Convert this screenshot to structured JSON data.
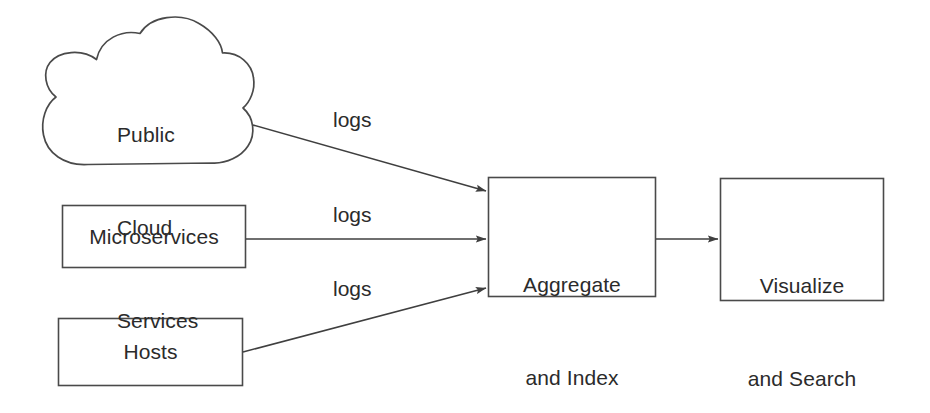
{
  "diagram": {
    "background_color": "#ffffff",
    "stroke_color": "#4a4a4a",
    "text_color": "#2b2b2b",
    "nodes": [
      {
        "id": "public-cloud-services",
        "shape": "cloud",
        "lines": [
          "Public",
          "Cloud",
          "Services"
        ],
        "text": "Public Cloud Services"
      },
      {
        "id": "microservices",
        "shape": "rectangle",
        "lines": [
          "Microservices"
        ],
        "text": "Microservices"
      },
      {
        "id": "hosts",
        "shape": "rectangle",
        "lines": [
          "Hosts"
        ],
        "text": "Hosts"
      },
      {
        "id": "aggregate-and-index",
        "shape": "rectangle",
        "lines": [
          "Aggregate",
          "and Index"
        ],
        "text": "Aggregate and Index"
      },
      {
        "id": "visualize-and-search",
        "shape": "rectangle",
        "lines": [
          "Visualize",
          "and Search"
        ],
        "text": "Visualize and Search"
      }
    ],
    "edges": [
      {
        "id": "cloud-to-aggregate",
        "from": "public-cloud-services",
        "to": "aggregate-and-index",
        "label": "logs"
      },
      {
        "id": "microservices-to-aggregate",
        "from": "microservices",
        "to": "aggregate-and-index",
        "label": "logs"
      },
      {
        "id": "hosts-to-aggregate",
        "from": "hosts",
        "to": "aggregate-and-index",
        "label": "logs"
      },
      {
        "id": "aggregate-to-visualize",
        "from": "aggregate-and-index",
        "to": "visualize-and-search",
        "label": ""
      }
    ]
  },
  "labels": {
    "cloud_line1": "Public",
    "cloud_line2": "Cloud",
    "cloud_line3": "Services",
    "microservices": "Microservices",
    "hosts": "Hosts",
    "aggregate_line1": "Aggregate",
    "aggregate_line2": "and Index",
    "visualize_line1": "Visualize",
    "visualize_line2": "and Search",
    "logs_top": "logs",
    "logs_middle": "logs",
    "logs_bottom": "logs"
  }
}
